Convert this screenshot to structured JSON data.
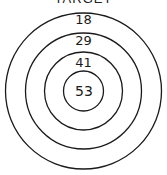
{
  "title": "TARGET",
  "diagram": {
    "type": "concentric-circles",
    "center": [
      83.5,
      91
    ],
    "rings": [
      {
        "label": "18",
        "radius": 78,
        "label_y": 24
      },
      {
        "label": "29",
        "radius": 58,
        "label_y": 45
      },
      {
        "label": "41",
        "radius": 39,
        "label_y": 67
      },
      {
        "label": "53",
        "radius": 20,
        "label_y": 96
      }
    ],
    "stroke_color": "#1a1a1a"
  }
}
